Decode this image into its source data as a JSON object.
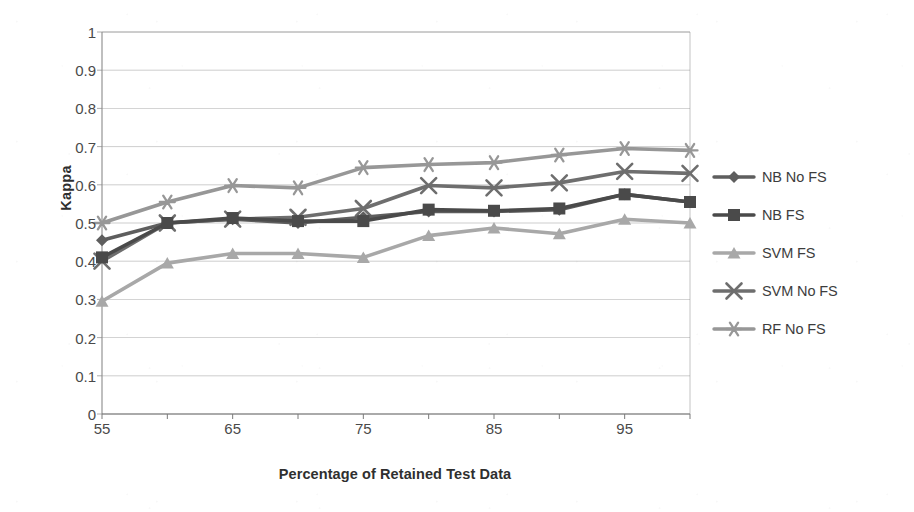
{
  "chart_data": {
    "type": "line",
    "title": "",
    "xlabel": "Percentage of Retained Test Data",
    "ylabel": "Kappa",
    "x": [
      55,
      60,
      65,
      70,
      75,
      80,
      85,
      90,
      95,
      100
    ],
    "xlim": [
      55,
      100
    ],
    "ylim": [
      0,
      1
    ],
    "grid": true,
    "legend_position": "right",
    "x_tick_labels": [
      "55",
      "",
      "65",
      "",
      "75",
      "",
      "85",
      "",
      "95",
      ""
    ],
    "y_tick_labels": [
      "0",
      "0.1",
      "0.2",
      "0.3",
      "0.4",
      "0.5",
      "0.6",
      "0.7",
      "0.8",
      "0.9",
      "1"
    ],
    "y_ticks": [
      0,
      0.1,
      0.2,
      0.3,
      0.4,
      0.5,
      0.6,
      0.7,
      0.8,
      0.9,
      1
    ],
    "series": [
      {
        "name": "NB No FS",
        "marker": "diamond",
        "color": "#5e5e5e",
        "values": [
          0.455,
          0.5,
          0.51,
          0.5,
          0.515,
          0.53,
          0.53,
          0.535,
          0.575,
          0.555
        ]
      },
      {
        "name": "NB FS",
        "marker": "square",
        "color": "#4a4a4a",
        "values": [
          0.41,
          0.5,
          0.513,
          0.505,
          0.505,
          0.535,
          0.532,
          0.538,
          0.575,
          0.555
        ]
      },
      {
        "name": "SVM FS",
        "marker": "triangle",
        "color": "#a8a8a8",
        "values": [
          0.295,
          0.395,
          0.42,
          0.42,
          0.41,
          0.467,
          0.487,
          0.472,
          0.51,
          0.5
        ]
      },
      {
        "name": "SVM No FS",
        "marker": "cross",
        "color": "#6e6e6e",
        "values": [
          0.4,
          0.5,
          0.51,
          0.515,
          0.538,
          0.598,
          0.592,
          0.605,
          0.635,
          0.63
        ]
      },
      {
        "name": "RF No FS",
        "marker": "asterisk",
        "color": "#979797",
        "values": [
          0.5,
          0.555,
          0.598,
          0.592,
          0.645,
          0.653,
          0.658,
          0.678,
          0.695,
          0.69
        ]
      }
    ]
  },
  "axes": {
    "y_title": "Kappa",
    "x_title": "Percentage of Retained Test Data"
  },
  "legend": {
    "entries": [
      {
        "label": "NB No FS"
      },
      {
        "label": "NB FS"
      },
      {
        "label": "SVM FS"
      },
      {
        "label": "SVM No FS"
      },
      {
        "label": "RF No FS"
      }
    ]
  },
  "style": {
    "gridline_color": "#9a9a9a",
    "axis_color": "#8a8a8a",
    "plot_background": "#ffffff"
  }
}
